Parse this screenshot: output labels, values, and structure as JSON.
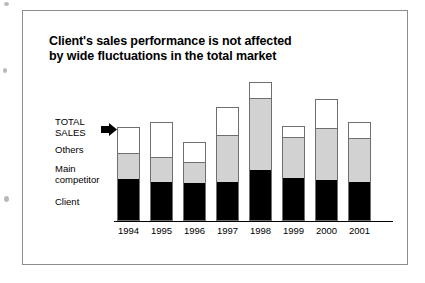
{
  "frame": {
    "border_color": "#8d8d8d"
  },
  "title": {
    "line1": "Client's sales performance is not affected",
    "line2": "by wide fluctuations in the total market"
  },
  "labels": {
    "total_sales": "TOTAL\nSALES",
    "others": "Others",
    "main_competitor": "Main\ncompetitor",
    "client": "Client"
  },
  "icons": {
    "total_sales_pointer": "right-arrow-icon"
  },
  "colors": {
    "client": "#000000",
    "main_competitor": "#d2d2d2",
    "others": "#ffffff",
    "bar_outline": "#6f6f6f",
    "axis": "#000000",
    "text": "#000000"
  },
  "chart_data": {
    "type": "bar",
    "stacked": true,
    "title": "Client's sales performance is not affected by wide fluctuations in the total market",
    "xlabel": "",
    "ylabel": "",
    "grid": false,
    "legend_position": "left-inline",
    "axis_range_px": {
      "baseline_y": 220,
      "top_y": 83
    },
    "categories": [
      "1994",
      "1995",
      "1996",
      "1997",
      "1998",
      "1999",
      "2000",
      "2001"
    ],
    "series": [
      {
        "name": "Client",
        "color": "#000000",
        "values": [
          41,
          38,
          37,
          38,
          50,
          42,
          40,
          38
        ]
      },
      {
        "name": "Main competitor",
        "color": "#d2d2d2",
        "values": [
          26,
          25,
          21,
          47,
          72,
          41,
          52,
          44
        ]
      },
      {
        "name": "Others",
        "color": "#ffffff",
        "values": [
          25,
          34,
          19,
          27,
          15,
          10,
          28,
          15
        ]
      }
    ],
    "totals": [
      92,
      97,
      77,
      112,
      137,
      93,
      120,
      97
    ],
    "units": "relative (pixel-derived) sales units",
    "annotations": [
      {
        "text": "TOTAL SALES",
        "target": "stack top",
        "marker": "right-arrow-icon"
      }
    ]
  }
}
